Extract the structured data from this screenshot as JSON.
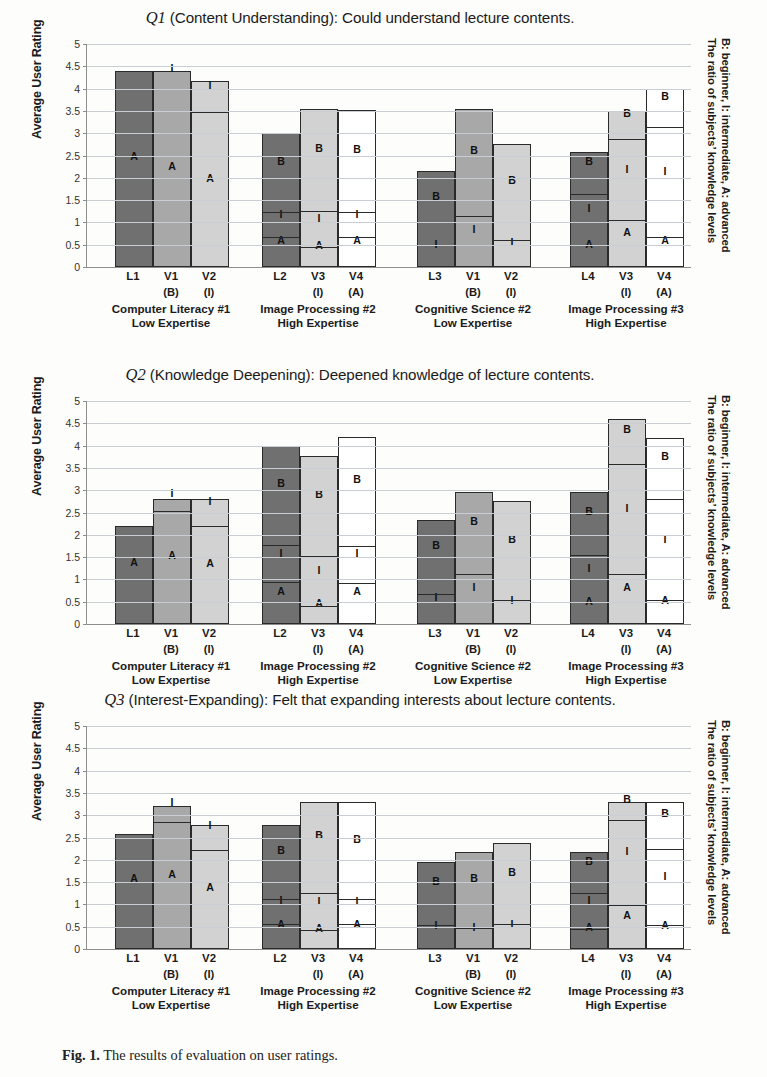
{
  "figure": {
    "caption_prefix": "Fig. 1.",
    "caption_text": "The results of evaluation on user ratings.",
    "colors": {
      "lecturer_bar": "#707070",
      "video1_bar": "#a8a8a8",
      "video2_bar": "#d2d2d2",
      "video_white_bar": "#ffffff",
      "outline": "#2a2a2a",
      "gridline": "#c9cdd4"
    }
  },
  "axis": {
    "ylabel": "Average User Rating",
    "yticks": [
      "0",
      "0.5",
      "1",
      "1.5",
      "2",
      "2.5",
      "3",
      "3.5",
      "4",
      "4.5",
      "5"
    ],
    "ymin": 0,
    "ymax": 5,
    "ystep": 0.5
  },
  "right_legend": {
    "line1": "The ratio of subjects’ knowledge levels",
    "line2": "B: beginner, I: intermediate,  A: advanced"
  },
  "groups": [
    {
      "id": "g1",
      "caption_line1": "Computer Literacy #1",
      "caption_line2": "Low Expertise",
      "bars": [
        {
          "label": "L1",
          "sub": "",
          "shade": "c1"
        },
        {
          "label": "V1",
          "sub": "(B)",
          "shade": "c2"
        },
        {
          "label": "V2",
          "sub": "(I)",
          "shade": "c3"
        }
      ]
    },
    {
      "id": "g2",
      "caption_line1": "Image Processing #2",
      "caption_line2": "High Expertise",
      "bars": [
        {
          "label": "L2",
          "sub": "",
          "shade": "c1"
        },
        {
          "label": "V3",
          "sub": "(I)",
          "shade": "c3"
        },
        {
          "label": "V4",
          "sub": "(A)",
          "shade": "c4"
        }
      ]
    },
    {
      "id": "g3",
      "caption_line1": "Cognitive Science #2",
      "caption_line2": "Low Expertise",
      "bars": [
        {
          "label": "L3",
          "sub": "",
          "shade": "c1"
        },
        {
          "label": "V1",
          "sub": "(B)",
          "shade": "c2"
        },
        {
          "label": "V2",
          "sub": "(I)",
          "shade": "c3"
        }
      ]
    },
    {
      "id": "g4",
      "caption_line1": "Image Processing #3",
      "caption_line2": "High Expertise",
      "bars": [
        {
          "label": "L4",
          "sub": "",
          "shade": "c1"
        },
        {
          "label": "V3",
          "sub": "(I)",
          "shade": "c3"
        },
        {
          "label": "V4",
          "sub": "(A)",
          "shade": "c4"
        }
      ]
    }
  ],
  "chart_data": [
    {
      "type": "bar",
      "id": "Q1",
      "title_q": "Q1",
      "title_rest": " (Content Understanding): Could understand lecture contents.",
      "xlabel": "",
      "ylabel": "Average User Rating",
      "ylim": [
        0,
        5
      ],
      "grid": true,
      "legend": "right-side vertical text",
      "categories": [
        "L1",
        "V1",
        "V2",
        "L2",
        "V3",
        "V4",
        "L3",
        "V1",
        "V2",
        "L4",
        "V3",
        "V4"
      ],
      "values": [
        4.4,
        4.4,
        4.18,
        3.0,
        3.55,
        3.52,
        2.15,
        3.55,
        2.75,
        2.57,
        3.5,
        4.0
      ],
      "stacks": [
        {
          "bar": "L1",
          "segments": [
            {
              "level": "A",
              "from": 0,
              "to": 4.4
            }
          ]
        },
        {
          "bar": "V1",
          "segments": [
            {
              "level": "A",
              "from": 0,
              "to": 3.95
            },
            {
              "level": "I",
              "from": 3.95,
              "to": 4.4
            }
          ]
        },
        {
          "bar": "V2",
          "segments": [
            {
              "level": "A",
              "from": 0,
              "to": 3.42
            },
            {
              "level": "I",
              "from": 3.42,
              "to": 4.18
            }
          ]
        },
        {
          "bar": "L2",
          "segments": [
            {
              "level": "A",
              "from": 0,
              "to": 0.63
            },
            {
              "level": "I",
              "from": 0.63,
              "to": 1.18
            },
            {
              "level": "B",
              "from": 1.18,
              "to": 3.0
            }
          ]
        },
        {
          "bar": "V3",
          "segments": [
            {
              "level": "A",
              "from": 0,
              "to": 0.4
            },
            {
              "level": "I",
              "from": 0.4,
              "to": 1.22
            },
            {
              "level": "B",
              "from": 1.22,
              "to": 3.55
            }
          ]
        },
        {
          "bar": "V4",
          "segments": [
            {
              "level": "A",
              "from": 0,
              "to": 0.62
            },
            {
              "level": "I",
              "from": 0.62,
              "to": 1.18
            },
            {
              "level": "B",
              "from": 1.18,
              "to": 3.52
            }
          ]
        },
        {
          "bar": "L3",
          "segments": [
            {
              "level": "I",
              "from": 0,
              "to": 0.45
            },
            {
              "level": "B",
              "from": 0.45,
              "to": 2.15
            }
          ]
        },
        {
          "bar": "V1b",
          "segments": [
            {
              "level": "I",
              "from": 0,
              "to": 1.1
            },
            {
              "level": "B",
              "from": 1.1,
              "to": 3.55
            }
          ]
        },
        {
          "bar": "V2b",
          "segments": [
            {
              "level": "I",
              "from": 0,
              "to": 0.55
            },
            {
              "level": "B",
              "from": 0.55,
              "to": 2.75
            }
          ]
        },
        {
          "bar": "L4",
          "segments": [
            {
              "level": "A",
              "from": 0,
              "to": 0.45
            },
            {
              "level": "I",
              "from": 0.45,
              "to": 1.6
            },
            {
              "level": "B",
              "from": 1.6,
              "to": 2.57
            }
          ]
        },
        {
          "bar": "V3b",
          "segments": [
            {
              "level": "A",
              "from": 0,
              "to": 1.0
            },
            {
              "level": "I",
              "from": 1.0,
              "to": 2.82
            },
            {
              "level": "B",
              "from": 2.82,
              "to": 3.5
            }
          ]
        },
        {
          "bar": "V4b",
          "segments": [
            {
              "level": "A",
              "from": 0,
              "to": 0.62
            },
            {
              "level": "I",
              "from": 0.62,
              "to": 3.1
            },
            {
              "level": "B",
              "from": 3.1,
              "to": 4.0
            }
          ]
        }
      ]
    },
    {
      "type": "bar",
      "id": "Q2",
      "title_q": "Q2",
      "title_rest": " (Knowledge Deepening): Deepened knowledge of lecture contents.",
      "xlabel": "",
      "ylabel": "Average User Rating",
      "ylim": [
        0,
        5
      ],
      "grid": true,
      "legend": "right-side vertical text",
      "categories": [
        "L1",
        "V1",
        "V2",
        "L2",
        "V3",
        "V4",
        "L3",
        "V1",
        "V2",
        "L4",
        "V3",
        "V4"
      ],
      "values": [
        2.2,
        2.8,
        2.8,
        4.0,
        3.77,
        4.2,
        2.33,
        2.97,
        2.75,
        2.97,
        4.6,
        4.18
      ],
      "stacks": [
        {
          "bar": "L1",
          "segments": [
            {
              "level": "A",
              "from": 0,
              "to": 2.2
            }
          ]
        },
        {
          "bar": "V1",
          "segments": [
            {
              "level": "A",
              "from": 0,
              "to": 2.5
            },
            {
              "level": "I",
              "from": 2.5,
              "to": 2.8
            }
          ]
        },
        {
          "bar": "V2",
          "segments": [
            {
              "level": "A",
              "from": 0,
              "to": 2.15
            },
            {
              "level": "I",
              "from": 2.15,
              "to": 2.8
            }
          ]
        },
        {
          "bar": "L2",
          "segments": [
            {
              "level": "A",
              "from": 0,
              "to": 0.9
            },
            {
              "level": "I",
              "from": 0.9,
              "to": 1.72
            },
            {
              "level": "B",
              "from": 1.72,
              "to": 4.0
            }
          ]
        },
        {
          "bar": "V3",
          "segments": [
            {
              "level": "A",
              "from": 0,
              "to": 0.35
            },
            {
              "level": "I",
              "from": 0.35,
              "to": 1.47
            },
            {
              "level": "B",
              "from": 1.47,
              "to": 3.77
            }
          ]
        },
        {
          "bar": "V4",
          "segments": [
            {
              "level": "A",
              "from": 0,
              "to": 0.88
            },
            {
              "level": "I",
              "from": 0.88,
              "to": 1.7
            },
            {
              "level": "B",
              "from": 1.7,
              "to": 4.2
            }
          ]
        },
        {
          "bar": "L3",
          "segments": [
            {
              "level": "I",
              "from": 0,
              "to": 0.62
            },
            {
              "level": "B",
              "from": 0.62,
              "to": 2.33
            }
          ]
        },
        {
          "bar": "V1b",
          "segments": [
            {
              "level": "I",
              "from": 0,
              "to": 1.08
            },
            {
              "level": "B",
              "from": 1.08,
              "to": 2.97
            }
          ]
        },
        {
          "bar": "V2b",
          "segments": [
            {
              "level": "I",
              "from": 0,
              "to": 0.5
            },
            {
              "level": "B",
              "from": 0.5,
              "to": 2.75
            }
          ]
        },
        {
          "bar": "L4",
          "segments": [
            {
              "level": "A",
              "from": 0,
              "to": 0.45
            },
            {
              "level": "I",
              "from": 0.45,
              "to": 1.5
            },
            {
              "level": "B",
              "from": 1.5,
              "to": 2.97
            }
          ]
        },
        {
          "bar": "V3b",
          "segments": [
            {
              "level": "A",
              "from": 0,
              "to": 1.08
            },
            {
              "level": "I",
              "from": 1.08,
              "to": 3.55
            },
            {
              "level": "B",
              "from": 3.55,
              "to": 4.6
            }
          ]
        },
        {
          "bar": "V4b",
          "segments": [
            {
              "level": "A",
              "from": 0,
              "to": 0.5
            },
            {
              "level": "I",
              "from": 0.5,
              "to": 2.75
            },
            {
              "level": "B",
              "from": 2.75,
              "to": 4.18
            }
          ]
        }
      ]
    },
    {
      "type": "bar",
      "id": "Q3",
      "title_q": "Q3",
      "title_rest": " (Interest-Expanding): Felt that expanding interests about lecture contents.",
      "xlabel": "",
      "ylabel": "Average User Rating",
      "ylim": [
        0,
        5
      ],
      "grid": true,
      "legend": "right-side vertical text",
      "categories": [
        "L1",
        "V1",
        "V2",
        "L2",
        "V3",
        "V4",
        "L3",
        "V1",
        "V2",
        "L4",
        "V3",
        "V4"
      ],
      "values": [
        2.58,
        3.2,
        2.78,
        2.78,
        3.3,
        3.3,
        1.95,
        2.18,
        2.37,
        2.18,
        3.3,
        3.3
      ],
      "stacks": [
        {
          "bar": "L1",
          "segments": [
            {
              "level": "A",
              "from": 0,
              "to": 2.58
            }
          ]
        },
        {
          "bar": "V1",
          "segments": [
            {
              "level": "A",
              "from": 0,
              "to": 2.8
            },
            {
              "level": "I",
              "from": 2.8,
              "to": 3.2
            }
          ]
        },
        {
          "bar": "V2",
          "segments": [
            {
              "level": "A",
              "from": 0,
              "to": 2.18
            },
            {
              "level": "I",
              "from": 2.18,
              "to": 2.78
            }
          ]
        },
        {
          "bar": "L2",
          "segments": [
            {
              "level": "A",
              "from": 0,
              "to": 0.52
            },
            {
              "level": "I",
              "from": 0.52,
              "to": 1.08
            },
            {
              "level": "B",
              "from": 1.08,
              "to": 2.78
            }
          ]
        },
        {
          "bar": "V3",
          "segments": [
            {
              "level": "A",
              "from": 0,
              "to": 0.38
            },
            {
              "level": "I",
              "from": 0.38,
              "to": 1.21
            },
            {
              "level": "B",
              "from": 1.21,
              "to": 3.3
            }
          ]
        },
        {
          "bar": "V4",
          "segments": [
            {
              "level": "A",
              "from": 0,
              "to": 0.52
            },
            {
              "level": "I",
              "from": 0.52,
              "to": 1.07
            },
            {
              "level": "B",
              "from": 1.07,
              "to": 3.3
            }
          ]
        },
        {
          "bar": "L3",
          "segments": [
            {
              "level": "I",
              "from": 0,
              "to": 0.5
            },
            {
              "level": "B",
              "from": 0.5,
              "to": 1.95
            }
          ]
        },
        {
          "bar": "V1b",
          "segments": [
            {
              "level": "I",
              "from": 0,
              "to": 0.42
            },
            {
              "level": "B",
              "from": 0.42,
              "to": 2.18
            }
          ]
        },
        {
          "bar": "V2b",
          "segments": [
            {
              "level": "I",
              "from": 0,
              "to": 0.52
            },
            {
              "level": "B",
              "from": 0.52,
              "to": 2.37
            }
          ]
        },
        {
          "bar": "L4",
          "segments": [
            {
              "level": "A",
              "from": 0,
              "to": 0.4
            },
            {
              "level": "I",
              "from": 0.4,
              "to": 1.2
            },
            {
              "level": "B",
              "from": 1.2,
              "to": 2.18
            }
          ]
        },
        {
          "bar": "V3b",
          "segments": [
            {
              "level": "A",
              "from": 0,
              "to": 0.95
            },
            {
              "level": "I",
              "from": 0.95,
              "to": 2.85
            },
            {
              "level": "B",
              "from": 2.85,
              "to": 3.3
            }
          ]
        },
        {
          "bar": "V4b",
          "segments": [
            {
              "level": "A",
              "from": 0,
              "to": 0.5
            },
            {
              "level": "I",
              "from": 0.5,
              "to": 2.2
            },
            {
              "level": "B",
              "from": 2.2,
              "to": 3.3
            }
          ]
        }
      ]
    }
  ]
}
